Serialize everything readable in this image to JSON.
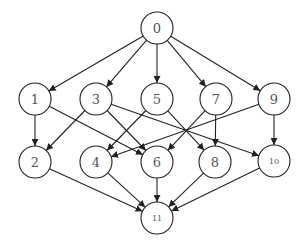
{
  "diagram": {
    "type": "directed-graph",
    "nodes": [
      {
        "id": "0",
        "label": "0",
        "x": 157,
        "y": 28
      },
      {
        "id": "1",
        "label": "1",
        "x": 35,
        "y": 99
      },
      {
        "id": "3",
        "label": "3",
        "x": 96,
        "y": 99
      },
      {
        "id": "5",
        "label": "5",
        "x": 157,
        "y": 99
      },
      {
        "id": "7",
        "label": "7",
        "x": 216,
        "y": 99
      },
      {
        "id": "9",
        "label": "9",
        "x": 274,
        "y": 99
      },
      {
        "id": "2",
        "label": "2",
        "x": 35,
        "y": 162
      },
      {
        "id": "4",
        "label": "4",
        "x": 96,
        "y": 162
      },
      {
        "id": "6",
        "label": "6",
        "x": 157,
        "y": 162
      },
      {
        "id": "8",
        "label": "8",
        "x": 215,
        "y": 162
      },
      {
        "id": "10",
        "label": "10",
        "x": 274,
        "y": 161
      },
      {
        "id": "11",
        "label": "11",
        "x": 157,
        "y": 218
      }
    ],
    "edges": [
      {
        "from": "0",
        "to": "1"
      },
      {
        "from": "0",
        "to": "3"
      },
      {
        "from": "0",
        "to": "5"
      },
      {
        "from": "0",
        "to": "7"
      },
      {
        "from": "0",
        "to": "9"
      },
      {
        "from": "1",
        "to": "2"
      },
      {
        "from": "1",
        "to": "6"
      },
      {
        "from": "3",
        "to": "2"
      },
      {
        "from": "3",
        "to": "6"
      },
      {
        "from": "3",
        "to": "10"
      },
      {
        "from": "5",
        "to": "4"
      },
      {
        "from": "5",
        "to": "8"
      },
      {
        "from": "7",
        "to": "6"
      },
      {
        "from": "7",
        "to": "8"
      },
      {
        "from": "9",
        "to": "4"
      },
      {
        "from": "9",
        "to": "10"
      },
      {
        "from": "2",
        "to": "11"
      },
      {
        "from": "4",
        "to": "11"
      },
      {
        "from": "6",
        "to": "11"
      },
      {
        "from": "8",
        "to": "11"
      },
      {
        "from": "10",
        "to": "11"
      }
    ],
    "node_radius": 16,
    "colors": {
      "stroke": "#222222",
      "label": "#555555",
      "background": "#ffffff"
    }
  }
}
